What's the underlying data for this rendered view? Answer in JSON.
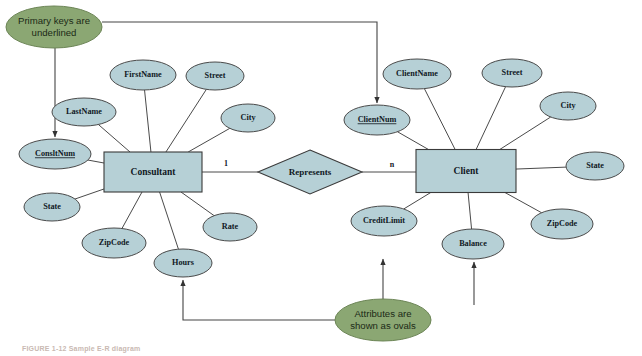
{
  "figure": {
    "caption": "FIGURE 1-12   Sample E-R diagram"
  },
  "colors": {
    "entity_fill": "#b6d0d6",
    "attribute_fill": "#b6d0d6",
    "note_fill": "#8ba773",
    "line": "#4a4a4a",
    "background": "#ffffff"
  },
  "entities": [
    {
      "name": "Consultant",
      "x": 153,
      "y": 172,
      "w": 98,
      "h": 40
    },
    {
      "name": "Client",
      "x": 466,
      "y": 171,
      "w": 100,
      "h": 43
    }
  ],
  "relationship": {
    "name": "Represents",
    "x": 310,
    "y": 172,
    "rx": 52,
    "ry": 22,
    "left_cardinality": "1",
    "right_cardinality": "n",
    "left_cardinality_x": 226,
    "left_cardinality_y": 164,
    "right_cardinality_x": 392,
    "right_cardinality_y": 165
  },
  "attributes": [
    {
      "name": "FirstName",
      "x": 143,
      "y": 75,
      "rx": 33,
      "ry": 15,
      "primary_key": false,
      "owner": "Consultant"
    },
    {
      "name": "Street",
      "x": 215,
      "y": 76,
      "rx": 29,
      "ry": 14,
      "primary_key": false,
      "owner": "Consultant"
    },
    {
      "name": "City",
      "x": 248,
      "y": 118,
      "rx": 27,
      "ry": 14,
      "primary_key": false,
      "owner": "Consultant"
    },
    {
      "name": "LastName",
      "x": 84,
      "y": 112,
      "rx": 32,
      "ry": 14,
      "primary_key": false,
      "owner": "Consultant"
    },
    {
      "name": "ConsltNum",
      "x": 55,
      "y": 154,
      "rx": 36,
      "ry": 15,
      "primary_key": true,
      "owner": "Consultant"
    },
    {
      "name": "State",
      "x": 52,
      "y": 207,
      "rx": 28,
      "ry": 14,
      "primary_key": false,
      "owner": "Consultant"
    },
    {
      "name": "ZipCode",
      "x": 114,
      "y": 243,
      "rx": 32,
      "ry": 15,
      "primary_key": false,
      "owner": "Consultant"
    },
    {
      "name": "Hours",
      "x": 183,
      "y": 263,
      "rx": 29,
      "ry": 14,
      "primary_key": false,
      "owner": "Consultant"
    },
    {
      "name": "Rate",
      "x": 230,
      "y": 227,
      "rx": 27,
      "ry": 14,
      "primary_key": false,
      "owner": "Consultant"
    },
    {
      "name": "ClientName",
      "x": 417,
      "y": 74,
      "rx": 34,
      "ry": 15,
      "primary_key": false,
      "owner": "Client"
    },
    {
      "name": "Street",
      "x": 512,
      "y": 73,
      "rx": 30,
      "ry": 14,
      "primary_key": false,
      "owner": "Client"
    },
    {
      "name": "City",
      "x": 568,
      "y": 106,
      "rx": 28,
      "ry": 14,
      "primary_key": false,
      "owner": "Client"
    },
    {
      "name": "ClientNum",
      "x": 377,
      "y": 120,
      "rx": 33,
      "ry": 15,
      "primary_key": true,
      "owner": "Client"
    },
    {
      "name": "State",
      "x": 595,
      "y": 166,
      "rx": 29,
      "ry": 14,
      "primary_key": false,
      "owner": "Client"
    },
    {
      "name": "ZipCode",
      "x": 562,
      "y": 224,
      "rx": 31,
      "ry": 15,
      "primary_key": false,
      "owner": "Client"
    },
    {
      "name": "Balance",
      "x": 473,
      "y": 244,
      "rx": 31,
      "ry": 15,
      "primary_key": false,
      "owner": "Client"
    },
    {
      "name": "CreditLimit",
      "x": 384,
      "y": 221,
      "rx": 33,
      "ry": 15,
      "primary_key": false,
      "owner": "Client"
    }
  ],
  "notes": [
    {
      "id": "primary-key-note",
      "line1": "Primary keys are",
      "line2": "underlined",
      "x": 54,
      "y": 27,
      "rx": 48,
      "ry": 21
    },
    {
      "id": "attributes-note",
      "line1": "Attributes are",
      "line2": "shown as ovals",
      "x": 383,
      "y": 320,
      "rx": 48,
      "ry": 21
    }
  ]
}
